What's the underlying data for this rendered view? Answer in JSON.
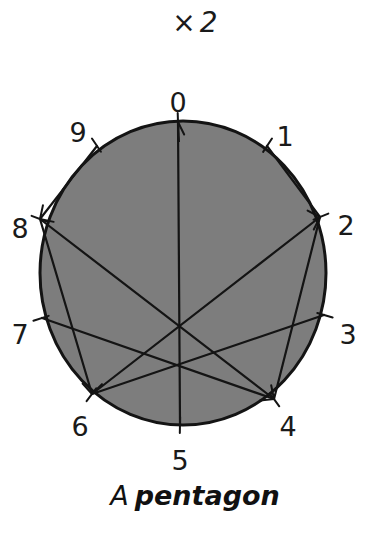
{
  "title": {
    "operator": "×",
    "factor": "2"
  },
  "diagram": {
    "type": "modular-multiplication-circle",
    "modulus": 10,
    "multiplier": 2,
    "disc_color": "#7d7d7d",
    "line_color": "#141414",
    "points": [
      {
        "label": "0",
        "x": 178,
        "y": 122,
        "lx": 178,
        "ly": 104
      },
      {
        "label": "1",
        "x": 267,
        "y": 146,
        "lx": 285,
        "ly": 138
      },
      {
        "label": "2",
        "x": 320,
        "y": 217,
        "lx": 346,
        "ly": 227
      },
      {
        "label": "3",
        "x": 324,
        "y": 315,
        "lx": 348,
        "ly": 336
      },
      {
        "label": "4",
        "x": 274,
        "y": 399,
        "lx": 288,
        "ly": 428
      },
      {
        "label": "5",
        "x": 180,
        "y": 424,
        "lx": 180,
        "ly": 462
      },
      {
        "label": "6",
        "x": 92,
        "y": 394,
        "lx": 80,
        "ly": 428
      },
      {
        "label": "7",
        "x": 42,
        "y": 318,
        "lx": 20,
        "ly": 336
      },
      {
        "label": "8",
        "x": 40,
        "y": 219,
        "lx": 20,
        "ly": 230
      },
      {
        "label": "9",
        "x": 97,
        "y": 146,
        "lx": 78,
        "ly": 134
      }
    ],
    "connections": [
      {
        "from": "1",
        "to": "2"
      },
      {
        "from": "2",
        "to": "4"
      },
      {
        "from": "3",
        "to": "6"
      },
      {
        "from": "4",
        "to": "8"
      },
      {
        "from": "5",
        "to": "0"
      },
      {
        "from": "6",
        "to": "2"
      },
      {
        "from": "7",
        "to": "4"
      },
      {
        "from": "8",
        "to": "6"
      },
      {
        "from": "9",
        "to": "8"
      }
    ]
  },
  "caption": {
    "article": "A",
    "shape": "pentagon"
  }
}
